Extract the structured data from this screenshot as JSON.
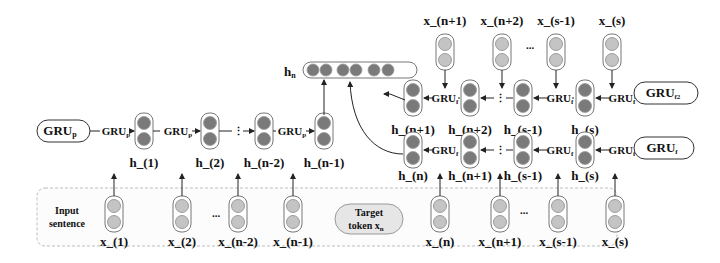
{
  "diagram": {
    "preceding_encoder": {
      "module_label": "GRU",
      "module_subscript": "p",
      "cell_label": "GRU",
      "cell_subscript": "p",
      "hidden_states": [
        "h_(1)",
        "h_(2)",
        "h_(n-2)",
        "h_(n-1)"
      ],
      "ellipsis": "⋮"
    },
    "following_encoder_1": {
      "module_label": "GRU",
      "module_subscript": "f2",
      "cell_label": "GRU",
      "cell_subscript": "f",
      "hidden_states": [
        "h_(n+1)",
        "h_(n+2)",
        "h_(s-1)",
        "h_(s)"
      ],
      "inputs": [
        "x_(n+1)",
        "x_(n+2)",
        "x_(s-1)",
        "x_(s)"
      ],
      "ellipsis": "⋮",
      "input_ellipsis": "..."
    },
    "following_encoder_2": {
      "module_label": "GRU",
      "module_subscript": "f",
      "cell_label": "GRU",
      "cell_subscript": "f",
      "hidden_states": [
        "h_(n)",
        "h_(n+1)",
        "h_(s-1)",
        "h_(s)"
      ],
      "ellipsis": "⋮"
    },
    "concatenated": {
      "label": "h",
      "subscript": "n"
    },
    "input_sentence": {
      "label_line1": "Input",
      "label_line2": "sentence",
      "left_tokens": [
        "x_(1)",
        "x_(2)",
        "x_(n-2)",
        "x_(n-1)"
      ],
      "right_tokens": [
        "x_(n)",
        "x_(n+1)",
        "x_(s-1)",
        "x_(s)"
      ],
      "ellipsis": "...",
      "target_line1": "Target",
      "target_line2": "token x",
      "target_subscript": "n"
    }
  }
}
